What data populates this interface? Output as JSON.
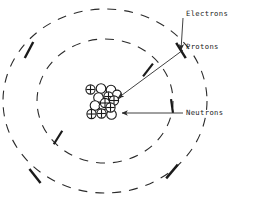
{
  "figure": {
    "type": "diagram",
    "background_color": "#ffffff",
    "ink_color": "#2b2b2b",
    "width": 261,
    "height": 203
  },
  "labels": {
    "electrons": "Electrons",
    "protons": "Protons",
    "neutrons": "Neutrons"
  },
  "nucleus": {
    "center": {
      "x": 105,
      "y": 101
    },
    "proton_symbol": "+",
    "proton_count": 7,
    "neutron_count": 7,
    "particles": [
      {
        "type": "proton",
        "x": 90.5,
        "y": 89.5,
        "r": 4.6
      },
      {
        "type": "neutron",
        "x": 101.0,
        "y": 88.5,
        "r": 4.8
      },
      {
        "type": "neutron",
        "x": 111.0,
        "y": 90.0,
        "r": 4.8
      },
      {
        "type": "proton",
        "x": 108.5,
        "y": 96.5,
        "r": 4.6
      },
      {
        "type": "neutron",
        "x": 117.0,
        "y": 94.5,
        "r": 4.4
      },
      {
        "type": "neutron",
        "x": 98.5,
        "y": 97.5,
        "r": 4.8
      },
      {
        "type": "proton",
        "x": 114.0,
        "y": 100.5,
        "r": 4.6
      },
      {
        "type": "proton",
        "x": 105.0,
        "y": 103.0,
        "r": 4.6
      },
      {
        "type": "neutron",
        "x": 95.0,
        "y": 105.5,
        "r": 4.8
      },
      {
        "type": "proton",
        "x": 110.5,
        "y": 107.5,
        "r": 4.6
      },
      {
        "type": "proton",
        "x": 91.5,
        "y": 114.0,
        "r": 4.6
      },
      {
        "type": "proton",
        "x": 101.5,
        "y": 113.5,
        "r": 4.6
      },
      {
        "type": "neutron",
        "x": 111.5,
        "y": 114.5,
        "r": 4.8
      },
      {
        "type": "neutron",
        "x": 103.0,
        "y": 106.0,
        "r": 4.0
      }
    ]
  },
  "orbits": [
    {
      "name": "inner-orbit",
      "cx": 105,
      "cy": 101,
      "rx": 68,
      "ry": 62,
      "style": "dashed",
      "electron_markers": [
        {
          "angle_deg": 312,
          "x": 148.0,
          "y": 70.0,
          "rot": -52
        },
        {
          "angle_deg": 222,
          "x": 58.0,
          "y": 137.5,
          "rot": -58
        },
        {
          "angle_deg": 5,
          "x": 172.0,
          "y": 106.0,
          "rot": 82
        }
      ]
    },
    {
      "name": "outer-orbit",
      "cx": 105,
      "cy": 101,
      "rx": 102,
      "ry": 92,
      "style": "dashed",
      "electron_markers": [
        {
          "angle_deg": 200,
          "x": 29.0,
          "y": 50.0,
          "rot": -62
        },
        {
          "angle_deg": 340,
          "x": 181.0,
          "y": 50.5,
          "rot": 58
        },
        {
          "angle_deg": 150,
          "x": 35.0,
          "y": 176.0,
          "rot": 52
        },
        {
          "angle_deg": 35,
          "x": 172.0,
          "y": 171.5,
          "rot": -50
        }
      ]
    }
  ],
  "leaders": [
    {
      "name": "electrons-leader",
      "label": "Electrons",
      "label_x": 186,
      "label_y": 14,
      "line": [
        [
          183,
          18
        ],
        [
          181,
          50
        ]
      ],
      "arrow_at": [
        181,
        50
      ],
      "arrow_dir": 160
    },
    {
      "name": "protons-leader",
      "label": "Protons",
      "label_x": 186,
      "label_y": 47,
      "line": [
        [
          183,
          50
        ],
        [
          116,
          98
        ]
      ],
      "arrow_at": [
        116,
        98
      ],
      "arrow_dir": 215
    },
    {
      "name": "neutrons-leader",
      "label": "Neutrons",
      "label_x": 186,
      "label_y": 113,
      "line": [
        [
          183,
          113
        ],
        [
          121,
          113
        ]
      ],
      "arrow_at": [
        121,
        113
      ],
      "arrow_dir": 180
    }
  ]
}
